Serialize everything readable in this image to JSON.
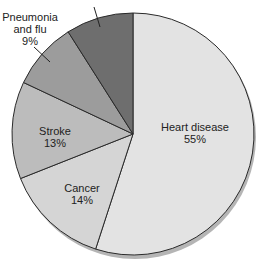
{
  "chart_data": {
    "type": "pie",
    "title": "",
    "start_angle_deg": 0,
    "direction": "clockwise",
    "slices": [
      {
        "label": "Heart disease",
        "value": 55,
        "value_label": "55%",
        "color": "#e3e3e3"
      },
      {
        "label": "Cancer",
        "value": 14,
        "value_label": "14%",
        "color": "#d5d5d5"
      },
      {
        "label": "Stroke",
        "value": 13,
        "value_label": "13%",
        "color": "#bcbcbc"
      },
      {
        "label": "Pneumonia and flu",
        "value": 9,
        "value_label": "9%",
        "color": "#9c9c9c"
      },
      {
        "label": "(label cut off at top)",
        "value": 9,
        "value_label": "",
        "color": "#6e6e6e"
      }
    ],
    "legend": "none (direct labels)"
  },
  "labels": {
    "heart": {
      "line1": "Heart disease",
      "line2": "55%"
    },
    "cancer": {
      "line1": "Cancer",
      "line2": "14%"
    },
    "stroke": {
      "line1": "Stroke",
      "line2": "13%"
    },
    "pneumonia": {
      "line1": "Pneumonia",
      "line2": "and flu",
      "line3": "9%"
    }
  }
}
